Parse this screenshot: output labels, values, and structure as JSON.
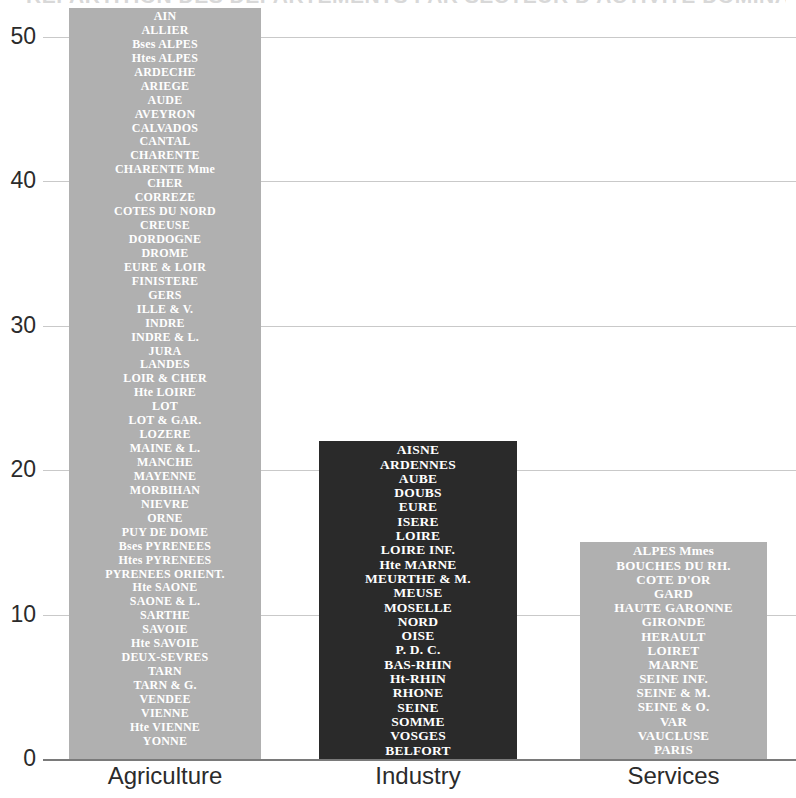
{
  "title": "REPARTITION DES DEPARTEMENTS PAR SECTEUR D'ACTIVITE DOMINANT",
  "axes": {
    "y_ticks": [
      "0",
      "10",
      "20",
      "30",
      "40",
      "50"
    ],
    "x_labels": [
      "Agriculture",
      "Industry",
      "Services"
    ]
  },
  "colors": {
    "agriculture": "#b0b0b0",
    "industry": "#2a2a2a",
    "services": "#b0b0b0",
    "gridline": "#c9c9c9",
    "axis": "#7a7a7a",
    "tick_text": "#2b2b2b",
    "bar_text": "#ffffff"
  },
  "chart_data": {
    "type": "bar",
    "title": "REPARTITION DES DEPARTEMENTS PAR SECTEUR D'ACTIVITE DOMINANT",
    "xlabel": "",
    "ylabel": "",
    "ylim": [
      0,
      52
    ],
    "yticks": [
      0,
      10,
      20,
      30,
      40,
      50
    ],
    "grid": true,
    "legend": false,
    "categories": [
      "Agriculture",
      "Industry",
      "Services"
    ],
    "values": [
      52,
      22,
      15
    ],
    "bar_colors": [
      "#b0b0b0",
      "#2a2a2a",
      "#b0b0b0"
    ],
    "annotations": {
      "note": "Each bar is annotated with the list of French departements belonging to that dominant sector; the number of names equals the bar height."
    },
    "members": {
      "Agriculture": [
        "AIN",
        "ALLIER",
        "Bses ALPES",
        "Htes ALPES",
        "ARDECHE",
        "ARIEGE",
        "AUDE",
        "AVEYRON",
        "CALVADOS",
        "CANTAL",
        "CHARENTE",
        "CHARENTE Mme",
        "CHER",
        "CORREZE",
        "COTES DU NORD",
        "CREUSE",
        "DORDOGNE",
        "DROME",
        "EURE & LOIR",
        "FINISTERE",
        "GERS",
        "ILLE & V.",
        "INDRE",
        "INDRE & L.",
        "JURA",
        "LANDES",
        "LOIR & CHER",
        "Hte LOIRE",
        "LOT",
        "LOT & GAR.",
        "LOZERE",
        "MAINE & L.",
        "MANCHE",
        "MAYENNE",
        "MORBIHAN",
        "NIEVRE",
        "ORNE",
        "PUY DE DOME",
        "Bses PYRENEES",
        "Htes PYRENEES",
        "PYRENEES ORIENT.",
        "Hte SAONE",
        "SAONE & L.",
        "SARTHE",
        "SAVOIE",
        "Hte SAVOIE",
        "DEUX-SEVRES",
        "TARN",
        "TARN & G.",
        "VENDEE",
        "VIENNE",
        "Hte VIENNE",
        "YONNE"
      ],
      "Industry": [
        "AISNE",
        "ARDENNES",
        "AUBE",
        "DOUBS",
        "EURE",
        "ISERE",
        "LOIRE",
        "LOIRE INF.",
        "Hte MARNE",
        "MEURTHE & M.",
        "MEUSE",
        "MOSELLE",
        "NORD",
        "OISE",
        "P. D. C.",
        "BAS-RHIN",
        "Ht-RHIN",
        "RHONE",
        "SEINE",
        "SOMME",
        "VOSGES",
        "BELFORT"
      ],
      "Services": [
        "ALPES Mmes",
        "BOUCHES DU RH.",
        "COTE D'OR",
        "GARD",
        "HAUTE GARONNE",
        "GIRONDE",
        "HERAULT",
        "LOIRET",
        "MARNE",
        "SEINE INF.",
        "SEINE & M.",
        "SEINE & O.",
        "VAR",
        "VAUCLUSE",
        "PARIS"
      ]
    }
  }
}
